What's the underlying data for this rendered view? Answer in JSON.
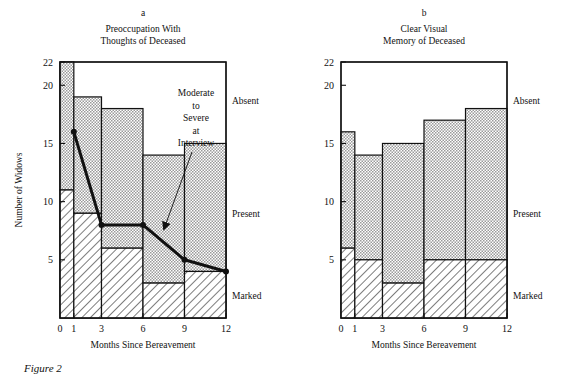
{
  "figure": {
    "caption": "Figure 2",
    "axis_x_label": "Months Since Bereavement",
    "axis_y_label": "Number of Widows",
    "category_labels": {
      "absent": "Absent",
      "present": "Present",
      "marked": "Marked"
    },
    "annotation": {
      "line1": "Moderate",
      "line2": "to",
      "line3": "Severe",
      "line4": "at",
      "line5": "Interview"
    }
  },
  "chart_data": [
    {
      "type": "bar",
      "panel": "a",
      "panel_letter": "a",
      "title": "Preoccupation With Thoughts of Deceased",
      "title_line1": "Preoccupation With",
      "title_line2": "Thoughts of Deceased",
      "xlabel": "Months Since Bereavement",
      "ylabel": "Number of Widows",
      "xlim": [
        0,
        12
      ],
      "ylim": [
        0,
        22
      ],
      "ytick_labels": [
        "5",
        "10",
        "15",
        "20",
        "22"
      ],
      "yticks": [
        5,
        10,
        15,
        20,
        22
      ],
      "xtick_labels": [
        "0",
        "1",
        "3",
        "6",
        "9",
        "12"
      ],
      "xticks": [
        0,
        1,
        3,
        6,
        9,
        12
      ],
      "bin_edges": [
        0,
        1,
        3,
        6,
        9,
        12
      ],
      "categories": [
        "0-1",
        "1-3",
        "3-6",
        "6-9",
        "9-12"
      ],
      "grid": false,
      "legend_position": "right-outside",
      "stack_order": [
        "Marked",
        "Present",
        "Absent"
      ],
      "series": [
        {
          "name": "Marked",
          "hatch": "diagonal",
          "values": [
            11,
            9,
            6,
            3,
            4
          ]
        },
        {
          "name": "Present",
          "hatch": "stipple",
          "values": [
            11,
            10,
            12,
            11,
            11
          ]
        },
        {
          "name": "Absent",
          "hatch": "none",
          "values": [
            0,
            3,
            4,
            8,
            7
          ]
        }
      ],
      "cumulative_present_top": [
        22,
        19,
        18,
        14,
        15
      ],
      "overlay_line": {
        "name": "Moderate to Severe at Interview",
        "x": [
          1,
          3,
          6,
          9,
          12
        ],
        "y": [
          16,
          8,
          8,
          5,
          4
        ],
        "marker": "circle"
      }
    },
    {
      "type": "bar",
      "panel": "b",
      "panel_letter": "b",
      "title": "Clear Visual Memory of Deceased",
      "title_line1": "Clear Visual",
      "title_line2": "Memory of Deceased",
      "xlabel": "Months Since Bereavement",
      "ylabel": "Number of Widows",
      "xlim": [
        0,
        12
      ],
      "ylim": [
        0,
        22
      ],
      "ytick_labels": [
        "5",
        "10",
        "15",
        "20",
        "22"
      ],
      "yticks": [
        5,
        10,
        15,
        20,
        22
      ],
      "xtick_labels": [
        "0",
        "1",
        "3",
        "6",
        "9",
        "12"
      ],
      "xticks": [
        0,
        1,
        3,
        6,
        9,
        12
      ],
      "bin_edges": [
        0,
        1,
        3,
        6,
        9,
        12
      ],
      "categories": [
        "0-1",
        "1-3",
        "3-6",
        "6-9",
        "9-12"
      ],
      "grid": false,
      "legend_position": "right-outside",
      "stack_order": [
        "Marked",
        "Present",
        "Absent"
      ],
      "series": [
        {
          "name": "Marked",
          "hatch": "diagonal",
          "values": [
            6,
            5,
            3,
            5,
            5
          ]
        },
        {
          "name": "Present",
          "hatch": "stipple",
          "values": [
            10,
            9,
            12,
            12,
            13
          ]
        },
        {
          "name": "Absent",
          "hatch": "none",
          "values": [
            6,
            8,
            7,
            5,
            4
          ]
        }
      ],
      "cumulative_present_top": [
        16,
        14,
        15,
        17,
        18
      ]
    }
  ],
  "colors": {
    "ink": "#111111",
    "stipple_fill": "#d0d0d0",
    "white": "#ffffff"
  }
}
